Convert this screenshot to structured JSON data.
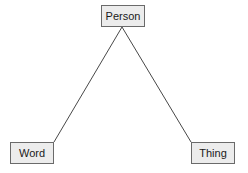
{
  "diagram": {
    "type": "semiotic-triangle",
    "nodes": [
      {
        "id": "person",
        "label": "Person",
        "position": "top"
      },
      {
        "id": "word",
        "label": "Word",
        "position": "bottom-left"
      },
      {
        "id": "thing",
        "label": "Thing",
        "position": "bottom-right"
      }
    ],
    "edges": [
      {
        "from": "person",
        "to": "word"
      },
      {
        "from": "person",
        "to": "thing"
      }
    ],
    "colors": {
      "node_fill": "#ececec",
      "node_border": "#6a6a6a",
      "line": "#333333"
    }
  }
}
